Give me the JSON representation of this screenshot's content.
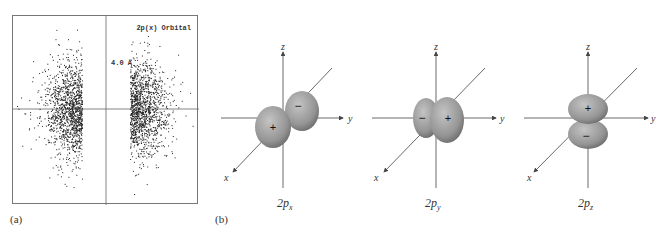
{
  "panel_a": {
    "label": "(a)",
    "title": "2p(x) Orbital",
    "scale": "4.0 Å",
    "description": "Electron density dot plot of 2p(x) orbital, two lobes along horizontal axis"
  },
  "panel_b": {
    "label": "(b)",
    "orbitals": [
      {
        "name": "2p",
        "sub": "x",
        "lobe1_sign": "+",
        "lobe2_sign": "−",
        "axes": {
          "x": "x",
          "y": "y",
          "z": "z"
        }
      },
      {
        "name": "2p",
        "sub": "y",
        "lobe1_sign": "−",
        "lobe2_sign": "+",
        "axes": {
          "x": "x",
          "y": "y",
          "z": "z"
        }
      },
      {
        "name": "2p",
        "sub": "z",
        "lobe1_sign": "+",
        "lobe2_sign": "−",
        "axes": {
          "x": "x",
          "y": "y",
          "z": "z"
        }
      }
    ]
  },
  "colors": {
    "lobe": "#9a9a9a",
    "lobe_dark": "#6f6f6f",
    "axis": "#444444",
    "dots": "#222222"
  }
}
